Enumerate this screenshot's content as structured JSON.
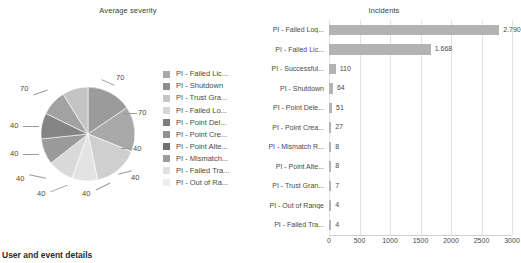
{
  "footer": {
    "heading": "User and event details"
  },
  "chart_data": [
    {
      "type": "pie",
      "title": "Average severity",
      "xlabel": "",
      "ylabel": "",
      "legend_position": "right",
      "grid": false,
      "categories": [
        "PI - Failed Lic...",
        "PI - Shutdown",
        "PI - Trust Gra...",
        "PI - Failed Lo...",
        "PI - Point Del...",
        "PI - Point Cre...",
        "PI - Point Alte...",
        "PI - Mismatch...",
        "PI - Failed Tra...",
        "PI - Out of Ra..."
      ],
      "values": [
        70,
        70,
        70,
        40,
        40,
        40,
        40,
        40,
        40
      ],
      "slice_labels": [
        "70",
        "70",
        "70",
        "40",
        "40",
        "40",
        "40",
        "40",
        "40"
      ],
      "colors": [
        "#a8a8a8",
        "#8e8e8e",
        "#c6c6c6",
        "#d6d6d6",
        "#7e7e7e",
        "#909090",
        "#6f6f6f",
        "#9c9c9c",
        "#e0e0e0",
        "#ededed"
      ],
      "slice_colors": [
        "#9b9b9b",
        "#a9a9a9",
        "#cfcfcf",
        "#e3e3e3",
        "#d9d9d9",
        "#9a9a9a",
        "#848484",
        "#a2a2a2",
        "#c4c4c4"
      ]
    },
    {
      "type": "bar",
      "orientation": "horizontal",
      "title": "Incidents",
      "xlabel": "",
      "ylabel": "",
      "grid": true,
      "xlim": [
        0,
        3000
      ],
      "xticks": [
        0,
        500,
        1000,
        1500,
        2000,
        2500,
        3000
      ],
      "xtick_labels": [
        "0",
        "500",
        "1000",
        "1500",
        "2000",
        "2500",
        "3000"
      ],
      "bar_color": "#b3b3b3",
      "categories": [
        "PI - Failed Log...",
        "PI - Failed Lic...",
        "PI - Successful...",
        "PI - Shutdown",
        "PI - Point Dele...",
        "PI - Point Crea...",
        "PI - Mismatch R...",
        "PI - Point Alte...",
        "PI - Trust Gran...",
        "PI - Out of Range",
        "PI - Failed Tra..."
      ],
      "values": [
        2790,
        1668,
        110,
        64,
        51,
        27,
        8,
        8,
        7,
        4,
        4
      ],
      "value_labels": [
        "2.790",
        "1.668",
        "110",
        "64",
        "51",
        "27",
        "8",
        "8",
        "7",
        "4",
        "4"
      ]
    }
  ]
}
